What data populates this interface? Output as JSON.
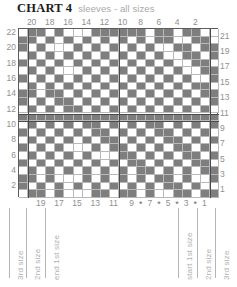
{
  "title": {
    "main": "CHART 4",
    "subtitle": "sleeves - all sizes"
  },
  "colors": {
    "filled_cell": "#7e7e7e",
    "empty_cell": "#ffffff",
    "grid_line": "#b9b9b9",
    "heavy_line": "#4a4a4a",
    "label_text": "#8f8f8f",
    "title_text": "#1b1b1b"
  },
  "chart_data": {
    "type": "heatmap",
    "title": "CHART 4 sleeves - all sizes",
    "columns": 22,
    "rows": 22,
    "legend": {
      "filled": "contrast colour stitch",
      "empty": "main colour stitch"
    },
    "column_numbers_top": [
      20,
      18,
      16,
      14,
      12,
      10,
      8,
      6,
      4,
      2
    ],
    "column_numbers_top_positions": [
      2,
      4,
      6,
      8,
      10,
      12,
      14,
      16,
      18,
      20
    ],
    "column_numbers_bottom": [
      19,
      17,
      15,
      13,
      11,
      9,
      7,
      5,
      3,
      1
    ],
    "column_numbers_bottom_positions": [
      3,
      5,
      7,
      9,
      11,
      13,
      15,
      17,
      19,
      21
    ],
    "row_numbers_left": [
      22,
      20,
      18,
      16,
      14,
      12,
      10,
      8,
      6,
      4,
      2
    ],
    "row_numbers_right": [
      21,
      19,
      17,
      15,
      13,
      11,
      9,
      7,
      5,
      3,
      1
    ],
    "asterisk_marks": "* * * *",
    "asterisk_columns": [
      14,
      16,
      18,
      20
    ],
    "grid": [
      [
        0,
        1,
        1,
        0,
        1,
        0,
        0,
        0,
        1,
        1,
        1,
        1,
        1,
        1,
        0,
        1,
        1,
        0,
        1,
        1,
        0,
        0
      ],
      [
        1,
        1,
        0,
        1,
        0,
        1,
        0,
        1,
        0,
        1,
        0,
        1,
        0,
        1,
        0,
        1,
        1,
        0,
        0,
        1,
        1,
        0
      ],
      [
        1,
        0,
        1,
        0,
        0,
        0,
        1,
        0,
        1,
        0,
        1,
        0,
        1,
        0,
        1,
        0,
        0,
        1,
        1,
        0,
        1,
        1
      ],
      [
        0,
        1,
        0,
        1,
        0,
        1,
        0,
        1,
        0,
        1,
        0,
        1,
        0,
        1,
        0,
        1,
        0,
        0,
        1,
        1,
        0,
        1
      ],
      [
        1,
        0,
        1,
        0,
        1,
        0,
        1,
        0,
        1,
        0,
        1,
        0,
        1,
        0,
        1,
        0,
        1,
        0,
        0,
        1,
        1,
        0
      ],
      [
        0,
        1,
        0,
        1,
        0,
        0,
        0,
        1,
        0,
        1,
        0,
        1,
        0,
        1,
        0,
        1,
        0,
        1,
        0,
        0,
        1,
        1
      ],
      [
        1,
        0,
        1,
        0,
        1,
        0,
        1,
        0,
        1,
        0,
        1,
        0,
        1,
        0,
        1,
        0,
        1,
        0,
        1,
        0,
        0,
        1
      ],
      [
        0,
        1,
        0,
        1,
        0,
        1,
        0,
        1,
        0,
        1,
        0,
        1,
        0,
        1,
        0,
        1,
        0,
        1,
        0,
        1,
        1,
        0
      ],
      [
        1,
        1,
        0,
        1,
        1,
        0,
        1,
        0,
        1,
        0,
        1,
        0,
        1,
        0,
        1,
        0,
        1,
        0,
        1,
        0,
        1,
        1
      ],
      [
        1,
        0,
        1,
        0,
        1,
        1,
        0,
        1,
        0,
        1,
        0,
        1,
        0,
        1,
        0,
        1,
        0,
        1,
        0,
        1,
        0,
        1
      ],
      [
        0,
        1,
        0,
        1,
        0,
        1,
        1,
        0,
        1,
        0,
        1,
        0,
        1,
        0,
        1,
        0,
        1,
        0,
        1,
        0,
        1,
        0
      ],
      [
        1,
        1,
        1,
        1,
        1,
        1,
        1,
        1,
        1,
        1,
        1,
        1,
        1,
        1,
        1,
        1,
        1,
        1,
        1,
        1,
        1,
        1
      ],
      [
        0,
        1,
        0,
        1,
        0,
        1,
        0,
        1,
        1,
        0,
        1,
        0,
        1,
        0,
        1,
        1,
        0,
        1,
        0,
        1,
        0,
        1
      ],
      [
        1,
        0,
        1,
        0,
        1,
        0,
        1,
        0,
        1,
        1,
        0,
        1,
        0,
        1,
        0,
        1,
        1,
        0,
        1,
        0,
        1,
        0
      ],
      [
        0,
        1,
        0,
        1,
        0,
        1,
        0,
        1,
        0,
        1,
        1,
        0,
        1,
        0,
        1,
        0,
        1,
        1,
        0,
        1,
        0,
        1
      ],
      [
        1,
        0,
        1,
        0,
        1,
        0,
        0,
        0,
        1,
        0,
        1,
        1,
        0,
        1,
        0,
        1,
        0,
        1,
        1,
        0,
        1,
        0
      ],
      [
        0,
        1,
        0,
        1,
        0,
        1,
        0,
        1,
        0,
        0,
        0,
        1,
        1,
        0,
        1,
        0,
        1,
        0,
        1,
        1,
        0,
        1
      ],
      [
        1,
        0,
        1,
        0,
        1,
        0,
        1,
        0,
        1,
        0,
        1,
        0,
        1,
        1,
        0,
        1,
        0,
        1,
        0,
        1,
        1,
        0
      ],
      [
        0,
        1,
        0,
        1,
        0,
        1,
        0,
        1,
        0,
        1,
        0,
        1,
        0,
        1,
        1,
        0,
        1,
        0,
        1,
        0,
        1,
        1
      ],
      [
        1,
        1,
        0,
        1,
        0,
        0,
        0,
        1,
        0,
        1,
        0,
        1,
        0,
        1,
        0,
        1,
        1,
        0,
        1,
        0,
        0,
        1
      ],
      [
        1,
        0,
        1,
        0,
        1,
        0,
        1,
        0,
        1,
        0,
        1,
        0,
        1,
        0,
        1,
        0,
        1,
        1,
        0,
        1,
        0,
        0
      ],
      [
        0,
        1,
        1,
        0,
        1,
        0,
        0,
        0,
        1,
        1,
        0,
        1,
        1,
        0,
        1,
        0,
        0,
        1,
        1,
        0,
        1,
        1
      ]
    ]
  },
  "size_labels": {
    "left": [
      {
        "text": "3rd size"
      },
      {
        "text": "2nd size"
      },
      {
        "text": "end 1st size"
      }
    ],
    "right": [
      {
        "text": "start 1st size"
      },
      {
        "text": "2nd size"
      },
      {
        "text": "3rd size"
      }
    ]
  }
}
